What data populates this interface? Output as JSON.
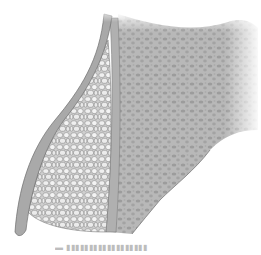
{
  "figure": {
    "regions": [
      {
        "name": "cortical-wall",
        "color": "#a9a9a9"
      },
      {
        "name": "graft-particles",
        "color": "#e6e6e6"
      },
      {
        "name": "trabecular-bone",
        "color": "#b5b5b5"
      }
    ],
    "caption": "▬ ▮▮▮▮▮▮▮▮▮▮▮▮▮▮▮▮▮▮"
  }
}
